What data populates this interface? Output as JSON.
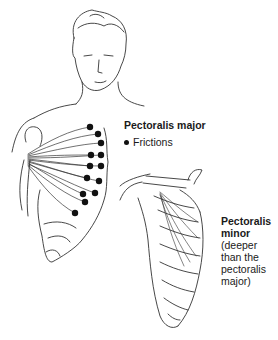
{
  "figure": {
    "labels": {
      "pectoralis_major": "Pectoralis major",
      "legend_frictions": "Frictions",
      "pectoralis_minor_title_1": "Pectoralis",
      "pectoralis_minor_title_2": "minor",
      "pectoralis_minor_note_1": "(deeper",
      "pectoralis_minor_note_2": "than the",
      "pectoralis_minor_note_3": "pectoralis",
      "pectoralis_minor_note_4": "major)"
    },
    "icons": {
      "legend_marker": "filled-dot-icon"
    },
    "friction_points": [
      [
        90,
        127
      ],
      [
        98,
        134
      ],
      [
        101,
        143
      ],
      [
        91,
        155
      ],
      [
        101,
        155
      ],
      [
        90,
        166
      ],
      [
        101,
        166
      ],
      [
        87,
        178
      ],
      [
        99,
        181
      ],
      [
        83,
        194
      ],
      [
        95,
        193
      ],
      [
        85,
        202
      ],
      [
        75,
        213
      ]
    ],
    "colors": {
      "line": "#333333",
      "dot": "#111111",
      "background": "#ffffff"
    }
  }
}
